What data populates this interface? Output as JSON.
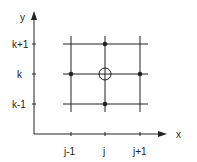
{
  "diagram": {
    "axes": {
      "x_label": "x",
      "y_label": "y",
      "x_ticks": [
        "j-1",
        "j",
        "j+1"
      ],
      "y_ticks": [
        "k+1",
        "k",
        "k-1"
      ]
    },
    "stencil": {
      "center": "open-circle",
      "neighbors": [
        "(j-1,k)",
        "(j+1,k)",
        "(j,k+1)",
        "(j,k-1)"
      ]
    },
    "colors": {
      "line": "#222222",
      "background": "#ffffff"
    }
  }
}
